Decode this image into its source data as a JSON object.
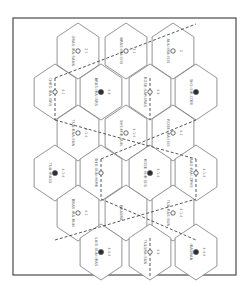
{
  "diagram": {
    "type": "hex-grid-map",
    "orientation": "rotated-90",
    "frame": {
      "x": 13,
      "y": 18,
      "width": 223,
      "height": 257
    },
    "colors": {
      "line": "#7a7a7a",
      "frame": "#4a4a4a",
      "dash": "#444444",
      "marker_filled": "#2e2e2e"
    },
    "hex_radius": 28,
    "hexes": [
      {
        "row": 1,
        "cx": 78,
        "cy": 51,
        "marker": "open",
        "label": "GRAS-IRA-SAUN",
        "code": "2-1"
      },
      {
        "row": 1,
        "cx": 126,
        "cy": 51,
        "marker": "open",
        "label": "BRAS-IRA-ISIS",
        "code": "3-1"
      },
      {
        "row": 1,
        "cx": 173,
        "cy": 51,
        "marker": "open",
        "label": "AUU-IRA-ISIS",
        "code": "2"
      },
      {
        "row": 2,
        "cx": 55,
        "cy": 92,
        "marker": "open",
        "label": "CHRS-IRA-ISRS",
        "code": "4-1"
      },
      {
        "row": 2,
        "cx": 101,
        "cy": 92,
        "marker": "filled",
        "label": "BRAS-IRA-ISRS",
        "code": "4-4"
      },
      {
        "row": 2,
        "cx": 150,
        "cy": 92,
        "marker": "open",
        "label": "ROSE-SAR-IRAS",
        "code": "4-4"
      },
      {
        "row": 2,
        "cx": 196,
        "cy": 92,
        "marker": "filled",
        "label": "SHS-SIR-IZER",
        "code": ""
      },
      {
        "row": 3,
        "cx": 78,
        "cy": 133,
        "marker": "open",
        "label": "TUA-RAA-SUN",
        "code": "4-1-4"
      },
      {
        "row": 3,
        "cx": 126,
        "cy": 133,
        "marker": "open",
        "label": "SHS-MIR-SUN",
        "code": "4-1-4"
      },
      {
        "row": 3,
        "cx": 173,
        "cy": 133,
        "marker": "open",
        "label": "ROSE-IRA-ISIS",
        "code": "4-1"
      },
      {
        "row": 4,
        "cx": 55,
        "cy": 173,
        "marker": "filled",
        "label": "TUA-IRASS",
        "code": "4-1-4"
      },
      {
        "row": 4,
        "cx": 101,
        "cy": 173,
        "marker": "open",
        "label": "B48-SUN-HIME",
        "code": ""
      },
      {
        "row": 4,
        "cx": 150,
        "cy": 173,
        "marker": "filled",
        "label": "ROSE-ISIR-ISIS",
        "code": "4-1-4"
      },
      {
        "row": 4,
        "cx": 196,
        "cy": 173,
        "marker": "open",
        "label": "AAO-PAH-ZPHS",
        "code": "4-1-4"
      },
      {
        "row": 5,
        "cx": 78,
        "cy": 213,
        "marker": "open",
        "label": "BRAS-IRA-RUN",
        "code": "4-1"
      },
      {
        "row": 5,
        "cx": 126,
        "cy": 213,
        "marker": "none",
        "label": "BRASRA",
        "code": ""
      },
      {
        "row": 5,
        "cx": 173,
        "cy": 213,
        "marker": "open",
        "label": "TUA-RAS-SUN",
        "code": "4-1-4"
      },
      {
        "row": 6,
        "cx": 101,
        "cy": 252,
        "marker": "filled",
        "label": "LAIS-SUN-IRAS",
        "code": "4-4-4"
      },
      {
        "row": 6,
        "cx": 150,
        "cy": 252,
        "marker": "open",
        "label": "TULSRA-SUN",
        "code": "4-4"
      },
      {
        "row": 6,
        "cx": 196,
        "cy": 252,
        "marker": "filled",
        "label": "IRASRAN",
        "code": "4-4-4"
      }
    ],
    "dashed_links": [
      {
        "x1": 55,
        "y1": 78,
        "x2": 196,
        "y2": 24
      },
      {
        "x1": 55,
        "y1": 78,
        "x2": 55,
        "y2": 120
      },
      {
        "x1": 150,
        "y1": 78,
        "x2": 150,
        "y2": 120
      },
      {
        "x1": 55,
        "y1": 120,
        "x2": 196,
        "y2": 159
      },
      {
        "x1": 101,
        "y1": 159,
        "x2": 196,
        "y2": 120
      },
      {
        "x1": 101,
        "y1": 159,
        "x2": 101,
        "y2": 199
      },
      {
        "x1": 196,
        "y1": 159,
        "x2": 196,
        "y2": 199
      },
      {
        "x1": 55,
        "y1": 240,
        "x2": 196,
        "y2": 199
      },
      {
        "x1": 101,
        "y1": 199,
        "x2": 196,
        "y2": 240
      },
      {
        "x1": 150,
        "y1": 238,
        "x2": 150,
        "y2": 278
      }
    ]
  }
}
